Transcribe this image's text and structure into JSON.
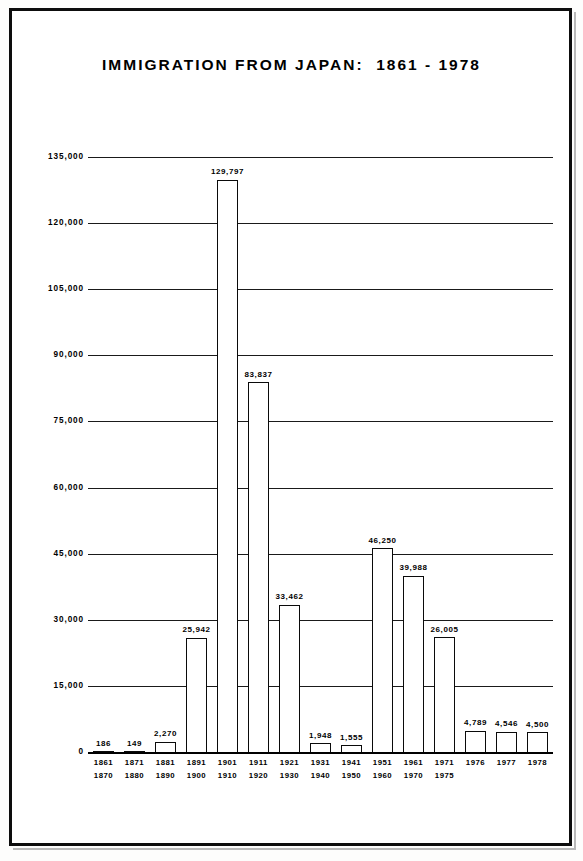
{
  "chart_data": {
    "type": "bar",
    "title": "IMMIGRATION FROM JAPAN:  1861 - 1978",
    "xlabel": "",
    "ylabel": "",
    "ylim": [
      0,
      135000
    ],
    "grid": true,
    "legend": "none",
    "ytick_labels": [
      "135,000",
      "120,000",
      "105,000",
      "90,000",
      "75,000",
      "60,000",
      "45,000",
      "30,000",
      "15,000",
      "0"
    ],
    "ytick_values": [
      135000,
      120000,
      105000,
      90000,
      75000,
      60000,
      45000,
      30000,
      15000,
      0
    ],
    "categories": [
      "1861\n1870",
      "1871\n1880",
      "1881\n1890",
      "1891\n1900",
      "1901\n1910",
      "1911\n1920",
      "1921\n1930",
      "1931\n1940",
      "1941\n1950",
      "1951\n1960",
      "1961\n1970",
      "1971\n1975",
      "1976",
      "1977",
      "1978"
    ],
    "values": [
      186,
      149,
      2270,
      25942,
      129797,
      83837,
      33462,
      1948,
      1555,
      46250,
      39988,
      26005,
      4789,
      4546,
      4500
    ],
    "value_labels": [
      "186",
      "149",
      "2,270",
      "25,942",
      "129,797",
      "83,837",
      "33,462",
      "1,948",
      "1,555",
      "46,250",
      "39,988",
      "26,005",
      "4,789",
      "4,546",
      "4,500"
    ],
    "bars": [
      {
        "period_start": "1861",
        "period_end": "1870",
        "value": 186,
        "label": "186"
      },
      {
        "period_start": "1871",
        "period_end": "1880",
        "value": 149,
        "label": "149"
      },
      {
        "period_start": "1881",
        "period_end": "1890",
        "value": 2270,
        "label": "2,270"
      },
      {
        "period_start": "1891",
        "period_end": "1900",
        "value": 25942,
        "label": "25,942"
      },
      {
        "period_start": "1901",
        "period_end": "1910",
        "value": 129797,
        "label": "129,797"
      },
      {
        "period_start": "1911",
        "period_end": "1920",
        "value": 83837,
        "label": "83,837"
      },
      {
        "period_start": "1921",
        "period_end": "1930",
        "value": 33462,
        "label": "33,462"
      },
      {
        "period_start": "1931",
        "period_end": "1940",
        "value": 1948,
        "label": "1,948"
      },
      {
        "period_start": "1941",
        "period_end": "1950",
        "value": 1555,
        "label": "1,555"
      },
      {
        "period_start": "1951",
        "period_end": "1960",
        "value": 46250,
        "label": "46,250"
      },
      {
        "period_start": "1961",
        "period_end": "1970",
        "value": 39988,
        "label": "39,988"
      },
      {
        "period_start": "1971",
        "period_end": "1975",
        "value": 26005,
        "label": "26,005"
      },
      {
        "period_start": "1976",
        "period_end": "",
        "value": 4789,
        "label": "4,789"
      },
      {
        "period_start": "1977",
        "period_end": "",
        "value": 4546,
        "label": "4,546"
      },
      {
        "period_start": "1978",
        "period_end": "",
        "value": 4500,
        "label": "4,500"
      }
    ],
    "colors": {
      "bar_fill": "#ffffff",
      "bar_outline": "#0a0a0a",
      "axis": "#000000",
      "grid": "#1a1a1a",
      "text": "#000000",
      "frame": "#0d0d0d",
      "background": "#ffffff"
    }
  }
}
